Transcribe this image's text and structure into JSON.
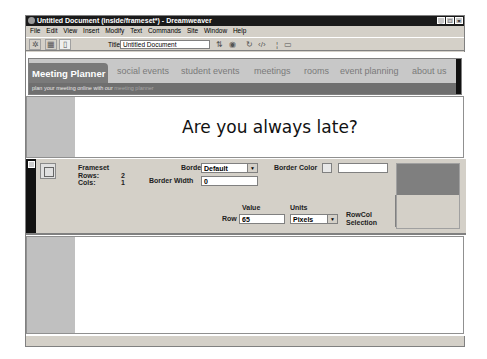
{
  "window": {
    "title": "Untitled Document (inside/frameset*) - Dreamweaver",
    "controls": [
      "_",
      "□",
      "×"
    ]
  },
  "menu": {
    "items": [
      "File",
      "Edit",
      "View",
      "Insert",
      "Modify",
      "Text",
      "Commands",
      "Site",
      "Window",
      "Help"
    ]
  },
  "toolbar": {
    "title_label": "Title:",
    "title_value": "Untitled Document",
    "icons": [
      "site-map-icon",
      "code-view-icon",
      "design-view-icon",
      "file-management-icon",
      "preview-browser-icon",
      "refresh-icon",
      "code-navigation-icon",
      "reference-icon"
    ]
  },
  "page": {
    "brand": "Meeting Planner",
    "nav": [
      "social events",
      "student events",
      "meetings",
      "rooms",
      "event planning",
      "about us"
    ],
    "tagline_prefix": "plan your meeting online with our",
    "tagline_highlight": "meeting planner",
    "heading": "Are you always late?"
  },
  "properties": {
    "type": "Frameset",
    "rows_label": "Rows:",
    "rows_value": "2",
    "cols_label": "Cols:",
    "cols_value": "1",
    "borders_label": "Borders",
    "borders_value": "Default",
    "border_width_label": "Border Width",
    "border_width_value": "0",
    "border_color_label": "Border Color",
    "border_color_value": "",
    "value_label": "Value",
    "units_label": "Units",
    "row_label": "Row",
    "row_value": "65",
    "units_value": "Pixels",
    "rowcol_label_1": "RowCol",
    "rowcol_label_2": "Selection"
  },
  "status": {
    "tag": "<frameset>",
    "size": "798 x 465",
    "download": "2K / 1 sec"
  }
}
